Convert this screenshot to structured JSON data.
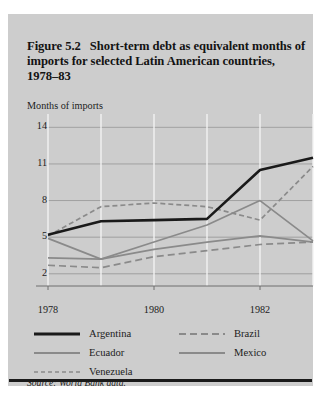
{
  "figure": {
    "number": "Figure 5.2",
    "title": "Short-term debt as equivalent months of imports for selected Latin American countries, 1978–83",
    "source": "Source: World Bank data."
  },
  "axis_note": "Months of imports",
  "legend": {
    "items": [
      {
        "label": "Argentina",
        "style": "thick-solid-black",
        "color": "#1a1a1a"
      },
      {
        "label": "Brazil",
        "style": "dashed-gray",
        "color": "#8a8a8a"
      },
      {
        "label": "Ecuador",
        "style": "solid-gray",
        "color": "#8a8a8a"
      },
      {
        "label": "Mexico",
        "style": "solid-gray",
        "color": "#8a8a8a"
      },
      {
        "label": "Venezuela",
        "style": "fine-dashed-gray",
        "color": "#8a8a8a"
      }
    ]
  },
  "chart_data": {
    "type": "line",
    "title": "Short-term debt as equivalent months of imports for selected Latin American countries, 1978–83",
    "xlabel": "",
    "ylabel": "Months of imports",
    "x": [
      1978,
      1979,
      1980,
      1981,
      1982,
      1983
    ],
    "xtick_labels": [
      "1978",
      "1980",
      "1982"
    ],
    "xticks": [
      1978,
      1980,
      1982
    ],
    "xlim": [
      1978,
      1983
    ],
    "ytick_labels": [
      "2",
      "5",
      "8",
      "11",
      "14"
    ],
    "yticks": [
      2,
      5,
      8,
      11,
      14
    ],
    "ylim": [
      1.0,
      14.6
    ],
    "grid": true,
    "legend_position": "below-plot",
    "series": [
      {
        "name": "Argentina",
        "color": "#1a1a1a",
        "dash": "none",
        "width": 2.6,
        "values": [
          5.2,
          6.3,
          6.4,
          6.5,
          10.5,
          11.5
        ]
      },
      {
        "name": "Brazil",
        "color": "#8a8a8a",
        "dash": "5,3",
        "width": 1.7,
        "values": [
          5.1,
          7.5,
          7.8,
          7.5,
          6.4,
          10.8
        ]
      },
      {
        "name": "Ecuador",
        "color": "#8a8a8a",
        "dash": "none",
        "width": 1.7,
        "values": [
          4.9,
          3.2,
          4.6,
          6.0,
          8.0,
          4.7
        ]
      },
      {
        "name": "Mexico",
        "color": "#8a8a8a",
        "dash": "none",
        "width": 1.7,
        "values": [
          3.3,
          3.2,
          4.0,
          4.6,
          5.1,
          4.6
        ]
      },
      {
        "name": "Venezuela",
        "color": "#8a8a8a",
        "dash": "7,4",
        "width": 1.7,
        "values": [
          2.7,
          2.5,
          3.4,
          3.9,
          4.4,
          4.6
        ]
      }
    ]
  }
}
